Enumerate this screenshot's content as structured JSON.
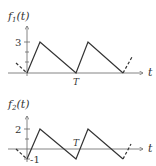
{
  "graphs": [
    {
      "ylabel": "f1(t)",
      "ylabel_main": "f",
      "ylabel_sub": "1",
      "ylabel_arg": "(t)",
      "xlabel": "t",
      "tick_label_top": "3",
      "period_label": "T",
      "description": "Sawtooth: rises from 0 to 3 quickly, decays linearly to 0 at T, repeats"
    },
    {
      "ylabel": "f2(t)",
      "ylabel_main": "f",
      "ylabel_sub": "2",
      "ylabel_arg": "(t)",
      "xlabel": "t",
      "tick_label_top": "2",
      "tick_label_bottom": "-1",
      "period_label": "T",
      "description": "Sawtooth: rises from -1 to 2 quickly, decays linearly to -1 at T, repeats"
    }
  ]
}
